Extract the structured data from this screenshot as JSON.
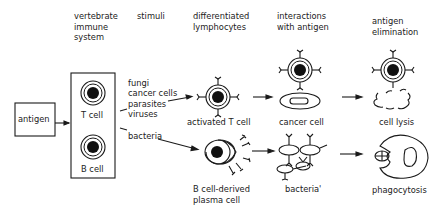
{
  "headers": {
    "immune_system": [
      "vertebrate",
      "immune",
      "system"
    ],
    "stimuli": "stimuli",
    "differentiated": [
      "differentiated",
      "lymphocytes"
    ],
    "interactions": [
      "interactions",
      "with antigen"
    ],
    "elimination": [
      "antigen",
      "elimination"
    ]
  },
  "nodes": {
    "antigen": "antigen",
    "t_cell": "T cell",
    "b_cell": "B cell",
    "stimuli_t": [
      "fungi",
      "cancer cells",
      "parasites",
      "viruses"
    ],
    "stimuli_b": "bacteria",
    "activated_t": "activated T cell",
    "plasma_cell": [
      "B cell-derived",
      "plasma cell"
    ],
    "cancer_cell": "cancer cell",
    "bacteria_target": "bacteria'",
    "cell_lysis": "cell lysis",
    "phagocytosis": "phagocytosis"
  }
}
